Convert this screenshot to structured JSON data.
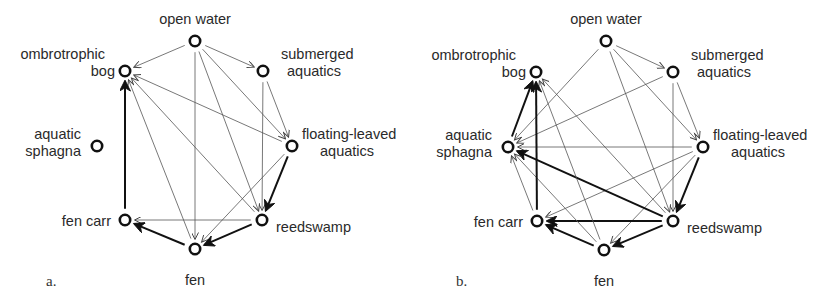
{
  "figure": {
    "panels": [
      {
        "id": "a",
        "label": "a.",
        "nodes": [
          {
            "id": "open_water",
            "lines": [
              "open water"
            ]
          },
          {
            "id": "ombrotrophic_bog",
            "lines": [
              "ombrotrophic",
              "bog"
            ]
          },
          {
            "id": "submerged_aquatics",
            "lines": [
              "submerged",
              "aquatics"
            ]
          },
          {
            "id": "aquatic_sphagna",
            "lines": [
              "aquatic",
              "sphagna"
            ]
          },
          {
            "id": "floating_leaved_aquatics",
            "lines": [
              "floating-leaved",
              "aquatics"
            ]
          },
          {
            "id": "fen_carr",
            "lines": [
              "fen carr"
            ]
          },
          {
            "id": "reedswamp",
            "lines": [
              "reedswamp"
            ]
          },
          {
            "id": "fen",
            "lines": [
              "fen"
            ]
          }
        ],
        "edges": [
          {
            "from": "open_water",
            "to": "ombrotrophic_bog",
            "strength": "weak"
          },
          {
            "from": "open_water",
            "to": "submerged_aquatics",
            "strength": "weak"
          },
          {
            "from": "open_water",
            "to": "fen",
            "strength": "weak"
          },
          {
            "from": "open_water",
            "to": "reedswamp",
            "strength": "weak"
          },
          {
            "from": "open_water",
            "to": "floating_leaved_aquatics",
            "strength": "weak"
          },
          {
            "from": "submerged_aquatics",
            "to": "floating_leaved_aquatics",
            "strength": "weak"
          },
          {
            "from": "submerged_aquatics",
            "to": "reedswamp",
            "strength": "weak"
          },
          {
            "from": "floating_leaved_aquatics",
            "to": "ombrotrophic_bog",
            "strength": "weak"
          },
          {
            "from": "floating_leaved_aquatics",
            "to": "reedswamp",
            "strength": "strong"
          },
          {
            "from": "floating_leaved_aquatics",
            "to": "fen",
            "strength": "weak"
          },
          {
            "from": "reedswamp",
            "to": "ombrotrophic_bog",
            "strength": "weak"
          },
          {
            "from": "reedswamp",
            "to": "fen_carr",
            "strength": "weak"
          },
          {
            "from": "reedswamp",
            "to": "fen",
            "strength": "strong"
          },
          {
            "from": "fen",
            "to": "ombrotrophic_bog",
            "strength": "weak"
          },
          {
            "from": "fen",
            "to": "fen_carr",
            "strength": "strong"
          },
          {
            "from": "fen_carr",
            "to": "ombrotrophic_bog",
            "strength": "strong"
          }
        ]
      },
      {
        "id": "b",
        "label": "b.",
        "nodes": [
          {
            "id": "open_water",
            "lines": [
              "open water"
            ]
          },
          {
            "id": "ombrotrophic_bog",
            "lines": [
              "ombrotrophic",
              "bog"
            ]
          },
          {
            "id": "submerged_aquatics",
            "lines": [
              "submerged",
              "aquatics"
            ]
          },
          {
            "id": "aquatic_sphagna",
            "lines": [
              "aquatic",
              "sphagna"
            ]
          },
          {
            "id": "floating_leaved_aquatics",
            "lines": [
              "floating-leaved",
              "aquatics"
            ]
          },
          {
            "id": "fen_carr",
            "lines": [
              "fen carr"
            ]
          },
          {
            "id": "reedswamp",
            "lines": [
              "reedswamp"
            ]
          },
          {
            "id": "fen",
            "lines": [
              "fen"
            ]
          }
        ],
        "edges": [
          {
            "from": "open_water",
            "to": "submerged_aquatics",
            "strength": "weak"
          },
          {
            "from": "open_water",
            "to": "aquatic_sphagna",
            "strength": "weak"
          },
          {
            "from": "open_water",
            "to": "floating_leaved_aquatics",
            "strength": "weak"
          },
          {
            "from": "open_water",
            "to": "reedswamp",
            "strength": "weak"
          },
          {
            "from": "submerged_aquatics",
            "to": "floating_leaved_aquatics",
            "strength": "weak"
          },
          {
            "from": "submerged_aquatics",
            "to": "aquatic_sphagna",
            "strength": "weak"
          },
          {
            "from": "submerged_aquatics",
            "to": "reedswamp",
            "strength": "weak"
          },
          {
            "from": "floating_leaved_aquatics",
            "to": "aquatic_sphagna",
            "strength": "weak"
          },
          {
            "from": "floating_leaved_aquatics",
            "to": "fen_carr",
            "strength": "weak"
          },
          {
            "from": "floating_leaved_aquatics",
            "to": "fen",
            "strength": "weak"
          },
          {
            "from": "floating_leaved_aquatics",
            "to": "reedswamp",
            "strength": "strong"
          },
          {
            "from": "reedswamp",
            "to": "ombrotrophic_bog",
            "strength": "weak"
          },
          {
            "from": "reedswamp",
            "to": "aquatic_sphagna",
            "strength": "strong"
          },
          {
            "from": "reedswamp",
            "to": "fen_carr",
            "strength": "strong"
          },
          {
            "from": "reedswamp",
            "to": "fen",
            "strength": "strong"
          },
          {
            "from": "fen",
            "to": "ombrotrophic_bog",
            "strength": "weak"
          },
          {
            "from": "fen",
            "to": "aquatic_sphagna",
            "strength": "weak"
          },
          {
            "from": "fen",
            "to": "fen_carr",
            "strength": "strong"
          },
          {
            "from": "fen_carr",
            "to": "aquatic_sphagna",
            "strength": "weak"
          },
          {
            "from": "fen_carr",
            "to": "ombrotrophic_bog",
            "strength": "strong"
          },
          {
            "from": "aquatic_sphagna",
            "to": "ombrotrophic_bog",
            "strength": "strong"
          }
        ]
      }
    ]
  }
}
